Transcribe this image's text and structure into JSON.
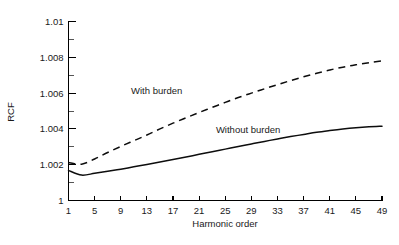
{
  "chart_data": {
    "type": "line",
    "title": "",
    "xlabel": "Harmonic order",
    "ylabel": "RCF",
    "xlim": [
      1,
      49
    ],
    "ylim": [
      1,
      1.01
    ],
    "grid": false,
    "legend_position": "inline-annotation",
    "x_ticks": [
      1,
      5,
      9,
      13,
      17,
      21,
      25,
      29,
      33,
      37,
      41,
      45,
      49
    ],
    "x_tick_labels": [
      "1",
      "5",
      "9",
      "13",
      "17",
      "21",
      "25",
      "29",
      "33",
      "37",
      "41",
      "45",
      "49"
    ],
    "y_ticks": [
      1,
      1.002,
      1.004,
      1.006,
      1.008,
      1.01
    ],
    "y_tick_labels": [
      "1",
      "1.002",
      "1.004",
      "1.006",
      "1.008",
      "1.01"
    ],
    "y_minor_ticks": [
      1.001,
      1.003,
      1.005,
      1.007,
      1.009
    ],
    "annotations": [
      {
        "text": "With burden",
        "x": 14.5,
        "y": 1.00595
      },
      {
        "text": "Without burden",
        "x": 28.5,
        "y": 1.00375
      }
    ],
    "series": [
      {
        "name": "With burden",
        "style": "dashed",
        "color": "#0d0d0d",
        "x": [
          1,
          3,
          5,
          7,
          9,
          11,
          13,
          15,
          17,
          19,
          21,
          23,
          25,
          27,
          29,
          31,
          33,
          35,
          37,
          39,
          41,
          43,
          45,
          47,
          49
        ],
        "y": [
          1.00212,
          1.00203,
          1.00232,
          1.00268,
          1.00302,
          1.00334,
          1.00366,
          1.004,
          1.00432,
          1.00462,
          1.00492,
          1.0052,
          1.00548,
          1.00575,
          1.006,
          1.00624,
          1.00647,
          1.0067,
          1.00691,
          1.00711,
          1.00729,
          1.00745,
          1.00758,
          1.0077,
          1.0078
        ]
      },
      {
        "name": "Without burden",
        "style": "solid",
        "color": "#0d0d0d",
        "x": [
          1,
          3,
          5,
          7,
          9,
          11,
          13,
          15,
          17,
          19,
          21,
          23,
          25,
          27,
          29,
          31,
          33,
          35,
          37,
          39,
          41,
          43,
          45,
          47,
          49
        ],
        "y": [
          1.00168,
          1.00142,
          1.00152,
          1.00163,
          1.00175,
          1.00188,
          1.00201,
          1.00215,
          1.00229,
          1.00243,
          1.00258,
          1.00272,
          1.00287,
          1.00302,
          1.00316,
          1.0033,
          1.00344,
          1.00357,
          1.00369,
          1.00381,
          1.00391,
          1.004,
          1.00407,
          1.00412,
          1.00415
        ]
      }
    ]
  },
  "axes": {
    "x_title": "Harmonic order",
    "y_title": "RCF"
  }
}
